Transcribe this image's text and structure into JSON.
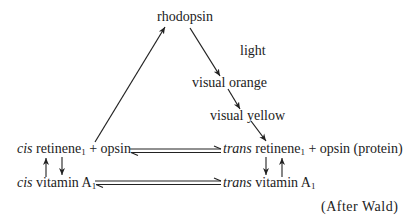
{
  "diagram": {
    "nodes": {
      "rhodopsin": "rhodopsin",
      "light": "light",
      "visual_orange": "visual orange",
      "visual_yellow": "visual yellow",
      "cis_prefix": "cis",
      "cis_retinene": "retinene",
      "cis_retinene_sub": "1",
      "plus_opsin_left": "+ opsin",
      "trans_prefix": "trans",
      "trans_retinene": "retinene",
      "trans_retinene_sub": "1",
      "plus_opsin_right": "+ opsin (protein)",
      "cis_vit_prefix": "cis",
      "cis_vitamin": "vitamin A",
      "cis_vitamin_sub": "1",
      "trans_vit_prefix": "trans",
      "trans_vitamin": "vitamin A",
      "trans_vitamin_sub": "1"
    },
    "credit": "(After Wald)",
    "edges": [
      {
        "from": "cis retinene1 + opsin",
        "to": "rhodopsin",
        "type": "arrow"
      },
      {
        "from": "rhodopsin",
        "to": "visual orange",
        "type": "arrow",
        "label": "light"
      },
      {
        "from": "visual orange",
        "to": "visual yellow",
        "type": "arrow"
      },
      {
        "from": "visual yellow",
        "to": "trans retinene1 + opsin",
        "type": "arrow"
      },
      {
        "from": "cis retinene1 + opsin",
        "to": "trans retinene1 + opsin",
        "type": "equilibrium"
      },
      {
        "from": "cis vitamin A1",
        "to": "trans vitamin A1",
        "type": "equilibrium"
      },
      {
        "from": "cis vitamin A1",
        "to": "cis retinene1",
        "type": "arrow"
      },
      {
        "from": "cis retinene1",
        "to": "cis vitamin A1",
        "type": "arrow"
      },
      {
        "from": "trans retinene1",
        "to": "trans vitamin A1",
        "type": "arrow"
      },
      {
        "from": "trans vitamin A1",
        "to": "trans retinene1",
        "type": "arrow"
      }
    ]
  }
}
